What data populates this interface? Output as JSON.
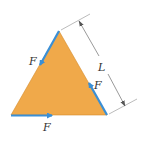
{
  "figure": {
    "labels": {
      "force_left": "F",
      "force_right": "F",
      "force_bottom": "F",
      "dimension": "L"
    },
    "colors": {
      "plate_fill": "#f0a94a",
      "plate_edge": "#d4892a",
      "arrow": "#3a8fd6",
      "dim_line": "#555555"
    }
  }
}
